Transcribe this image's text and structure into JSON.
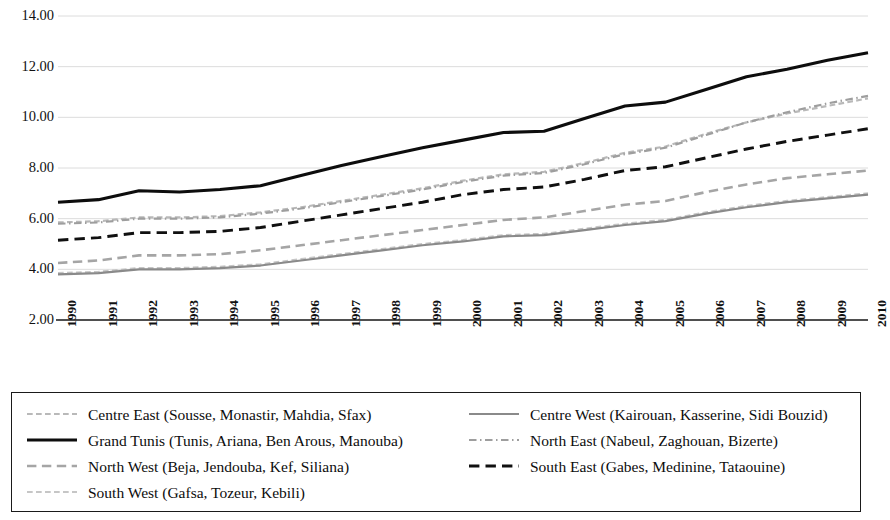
{
  "chart_data": {
    "type": "line",
    "title": "",
    "subtitle": "",
    "xlabel": "",
    "ylabel": "",
    "xlim": [
      1990,
      2010
    ],
    "ylim": [
      2.0,
      14.0
    ],
    "ytick_step": 2.0,
    "grid": true,
    "grid_axis": "y",
    "legend_position": "below-plot",
    "legend_columns": 2,
    "ytick_format": "0.00",
    "x": [
      1990,
      1991,
      1992,
      1993,
      1994,
      1995,
      1996,
      1997,
      1998,
      1999,
      2000,
      2001,
      2002,
      2003,
      2004,
      2005,
      2006,
      2007,
      2008,
      2009,
      2010
    ],
    "xtick_labels": [
      "1990",
      "1991",
      "1992",
      "1993",
      "1994",
      "1995",
      "1996",
      "1997",
      "1998",
      "1999",
      "2000",
      "2001",
      "2002",
      "2003",
      "2004",
      "2005",
      "2006",
      "2007",
      "2008",
      "2009",
      "2010"
    ],
    "ytick_labels": [
      "2.00",
      "4.00",
      "6.00",
      "8.00",
      "10.00",
      "12.00",
      "14.00"
    ],
    "ytick_values": [
      2.0,
      4.0,
      6.0,
      8.0,
      10.0,
      12.0,
      14.0
    ],
    "series": [
      {
        "name": "Centre East (Sousse, Monastir, Mahdia, Sfax)",
        "short_name": "Centre East",
        "style": "dotted",
        "color": "#b9b9b9",
        "width": 2.2,
        "values": [
          5.85,
          5.9,
          6.05,
          6.05,
          6.1,
          6.25,
          6.45,
          6.7,
          6.95,
          7.2,
          7.5,
          7.75,
          7.85,
          8.2,
          8.6,
          8.85,
          9.35,
          9.8,
          10.15,
          10.45,
          10.75
        ]
      },
      {
        "name": "Centre West (Kairouan, Kasserine, Sidi Bouzid)",
        "short_name": "Centre West",
        "style": "solid",
        "color": "#8a8a8a",
        "width": 2.2,
        "values": [
          3.8,
          3.85,
          4.0,
          4.0,
          4.05,
          4.15,
          4.35,
          4.55,
          4.75,
          4.95,
          5.1,
          5.3,
          5.35,
          5.55,
          5.75,
          5.9,
          6.2,
          6.45,
          6.65,
          6.8,
          6.95
        ]
      },
      {
        "name": "Grand Tunis (Tunis, Ariana, Ben Arous, Manouba)",
        "short_name": "Grand Tunis",
        "style": "solid",
        "color": "#0d0d0d",
        "width": 3.1,
        "values": [
          6.65,
          6.75,
          7.1,
          7.05,
          7.15,
          7.3,
          7.7,
          8.1,
          8.45,
          8.8,
          9.1,
          9.4,
          9.45,
          9.95,
          10.45,
          10.6,
          11.1,
          11.6,
          11.9,
          12.25,
          12.55
        ]
      },
      {
        "name": "North East (Nabeul, Zaghouan, Bizerte)",
        "short_name": "North East",
        "style": "dash-dot",
        "color": "#9e9e9e",
        "width": 2.2,
        "values": [
          5.8,
          5.85,
          6.0,
          6.0,
          6.05,
          6.2,
          6.4,
          6.65,
          6.9,
          7.15,
          7.45,
          7.7,
          7.8,
          8.15,
          8.55,
          8.8,
          9.3,
          9.8,
          10.2,
          10.55,
          10.85
        ]
      },
      {
        "name": "North West (Beja, Jendouba, Kef, Siliana)",
        "short_name": "North West",
        "style": "dashed",
        "color": "#a5a5a5",
        "width": 2.6,
        "values": [
          4.25,
          4.35,
          4.55,
          4.55,
          4.6,
          4.75,
          4.95,
          5.15,
          5.35,
          5.55,
          5.75,
          5.95,
          6.05,
          6.3,
          6.55,
          6.7,
          7.05,
          7.35,
          7.6,
          7.75,
          7.9
        ]
      },
      {
        "name": "South East (Gabes, Medinine, Tataouine)",
        "short_name": "South East",
        "style": "dashed",
        "color": "#101010",
        "width": 2.9,
        "values": [
          5.15,
          5.25,
          5.45,
          5.45,
          5.5,
          5.65,
          5.9,
          6.15,
          6.4,
          6.65,
          6.95,
          7.15,
          7.25,
          7.55,
          7.9,
          8.05,
          8.4,
          8.75,
          9.05,
          9.3,
          9.55
        ]
      },
      {
        "name": "South West (Gafsa, Tozeur, Kebili)",
        "short_name": "South West",
        "style": "dotted",
        "color": "#c6c6c6",
        "width": 2.2,
        "values": [
          3.85,
          3.9,
          4.05,
          4.05,
          4.1,
          4.2,
          4.4,
          4.6,
          4.8,
          5.0,
          5.15,
          5.35,
          5.4,
          5.6,
          5.8,
          5.95,
          6.25,
          6.5,
          6.7,
          6.85,
          7.0
        ]
      }
    ]
  },
  "legend": {
    "items": [
      {
        "label": "Centre East (Sousse, Monastir, Mahdia, Sfax)",
        "series_index": 0,
        "column": 0,
        "row": 0
      },
      {
        "label": "Centre West (Kairouan, Kasserine, Sidi Bouzid)",
        "series_index": 1,
        "column": 1,
        "row": 0
      },
      {
        "label": "Grand Tunis (Tunis, Ariana, Ben Arous, Manouba)",
        "series_index": 2,
        "column": 0,
        "row": 1
      },
      {
        "label": "North East (Nabeul, Zaghouan, Bizerte)",
        "series_index": 3,
        "column": 1,
        "row": 1
      },
      {
        "label": "North West (Beja, Jendouba, Kef, Siliana)",
        "series_index": 4,
        "column": 0,
        "row": 2
      },
      {
        "label": "South East (Gabes, Medinine, Tataouine)",
        "series_index": 5,
        "column": 1,
        "row": 2
      },
      {
        "label": "South West (Gafsa, Tozeur, Kebili)",
        "series_index": 6,
        "column": 0,
        "row": 3
      }
    ]
  },
  "axes": {
    "x_axis_line_color": "#1a1a1a",
    "gridline_color": "#dcdcdc"
  }
}
